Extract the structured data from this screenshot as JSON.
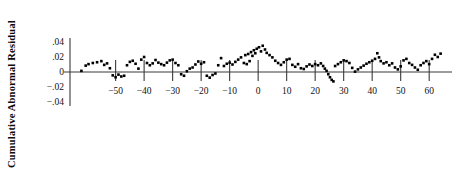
{
  "chart_data": {
    "type": "scatter",
    "title": "",
    "subtitle": "",
    "xlabel": "",
    "ylabel": "Cumulative Abnormal Residual",
    "xlim": [
      -66,
      68
    ],
    "ylim": [
      -0.045,
      0.047
    ],
    "xticks": [
      -50,
      -40,
      -30,
      -20,
      -10,
      0,
      10,
      20,
      30,
      40,
      50,
      60
    ],
    "xticklabels": [
      "−50",
      "−40",
      "−30",
      "−20",
      "−10",
      "0",
      "10",
      "20",
      "30",
      "40",
      "50",
      "60"
    ],
    "yticks": [
      0.04,
      0.02,
      0,
      -0.02,
      -0.04
    ],
    "yticklabels": [
      ".04",
      ".02",
      "0",
      "−.02",
      "−.04"
    ],
    "grid": false,
    "legend": null,
    "legend_position": "none",
    "marker": "square",
    "marker_color": "#000000",
    "marker_size": 2.6,
    "axis_color": "#3a3a3a",
    "zero_line": 0,
    "x": [
      -62,
      -61,
      -60,
      -59,
      -58,
      -57,
      -56,
      -55,
      -54,
      -53,
      -52,
      -51,
      -50,
      -49,
      -48,
      -47,
      -46,
      -45,
      -44,
      -43,
      -42,
      -41,
      -40,
      -39,
      -38,
      -37,
      -36,
      -35,
      -34,
      -33,
      -32,
      -31,
      -30,
      -29,
      -28,
      -27,
      -26,
      -25,
      -24,
      -23,
      -22,
      -21,
      -20,
      -19,
      -18,
      -17,
      -16,
      -15,
      -14,
      -13,
      -12,
      -11,
      -10,
      -9,
      -8,
      -7,
      -6,
      -5,
      -4,
      -3,
      -2,
      -1,
      0,
      1,
      2,
      3,
      4,
      5,
      6,
      7,
      8,
      9,
      10,
      11,
      12,
      13,
      14,
      15,
      16,
      17,
      18,
      19,
      20,
      21,
      22,
      23,
      24,
      25,
      26,
      27,
      28,
      29,
      30,
      31,
      32,
      33,
      34,
      35,
      36,
      37,
      38,
      39,
      40,
      41,
      42,
      43,
      44,
      45,
      46,
      47,
      48,
      49,
      50,
      51,
      52,
      53,
      54,
      55,
      56,
      57,
      58,
      59,
      60,
      61,
      62,
      63,
      64
    ],
    "y": [
      0.002,
      0.008,
      0.01,
      0.012,
      0.009,
      0.014,
      0.013,
      0.011,
      0.015,
      0.004,
      -0.004,
      -0.006,
      -0.003,
      -0.007,
      -0.005,
      0.009,
      0.013,
      0.015,
      0.011,
      0.004,
      0.016,
      0.02,
      0.012,
      0.009,
      0.011,
      0.016,
      0.013,
      0.011,
      0.009,
      0.012,
      0.015,
      0.016,
      0.012,
      0.009,
      -0.003,
      -0.005,
      0.001,
      0.004,
      0.006,
      0.01,
      0.014,
      0.011,
      0.013,
      -0.005,
      -0.007,
      -0.004,
      -0.002,
      0.009,
      0.018,
      0.008,
      0.011,
      0.012,
      0.01,
      0.013,
      0.016,
      0.019,
      0.012,
      0.01,
      0.011,
      0.014,
      0.017,
      0.02,
      0.021,
      0.023,
      0.026,
      0.024,
      0.031,
      0.027,
      0.03,
      0.033,
      0.035,
      0.028,
      0.03,
      0.034,
      0.032,
      0.03,
      0.036,
      0.033,
      0.035,
      0.031,
      0.028,
      0.024,
      0.021,
      0.017,
      0.013,
      0.009,
      0.012,
      0.016,
      0.019,
      0.018,
      0.009,
      0.006,
      0.005,
      0.01,
      0.008,
      0.005,
      0.004,
      0.007,
      0.01,
      0.008,
      0.006,
      0.004,
      0.012,
      0.01,
      0.009,
      0.005,
      0.002,
      -0.003,
      -0.007,
      -0.01,
      -0.012,
      0.002,
      0.006,
      0.01,
      0.013,
      0.011,
      0.015,
      0.017,
      0.014,
      0.012,
      0.009,
      0.0,
      0.0,
      0.0,
      0.0,
      0.0,
      0.0
    ]
  },
  "scatter_points": [
    {
      "x": -62,
      "y": 0.0015
    },
    {
      "x": -60.5,
      "y": 0.0085
    },
    {
      "x": -59.5,
      "y": 0.0105
    },
    {
      "x": -58,
      "y": 0.012
    },
    {
      "x": -56.5,
      "y": 0.013
    },
    {
      "x": -55,
      "y": 0.0145
    },
    {
      "x": -54,
      "y": 0.0095
    },
    {
      "x": -53,
      "y": 0.0115
    },
    {
      "x": -52,
      "y": 0.005
    },
    {
      "x": -51,
      "y": -0.0045
    },
    {
      "x": -50,
      "y": -0.007
    },
    {
      "x": -49,
      "y": -0.0035
    },
    {
      "x": -48,
      "y": -0.006
    },
    {
      "x": -47,
      "y": -0.005
    },
    {
      "x": -46,
      "y": 0.009
    },
    {
      "x": -45,
      "y": 0.0135
    },
    {
      "x": -44,
      "y": 0.015
    },
    {
      "x": -43,
      "y": 0.011
    },
    {
      "x": -42,
      "y": 0.0045
    },
    {
      "x": -41,
      "y": 0.0165
    },
    {
      "x": -40,
      "y": 0.02
    },
    {
      "x": -39,
      "y": 0.012
    },
    {
      "x": -38,
      "y": 0.009
    },
    {
      "x": -37,
      "y": 0.0115
    },
    {
      "x": -36,
      "y": 0.016
    },
    {
      "x": -35,
      "y": 0.0125
    },
    {
      "x": -34,
      "y": 0.0105
    },
    {
      "x": -33,
      "y": 0.009
    },
    {
      "x": -32,
      "y": 0.0125
    },
    {
      "x": -31,
      "y": 0.0155
    },
    {
      "x": -30,
      "y": 0.0165
    },
    {
      "x": -29,
      "y": 0.012
    },
    {
      "x": -28,
      "y": 0.009
    },
    {
      "x": -27,
      "y": -0.003
    },
    {
      "x": -26,
      "y": -0.005
    },
    {
      "x": -25,
      "y": 0.001
    },
    {
      "x": -24,
      "y": 0.0045
    },
    {
      "x": -23,
      "y": 0.006
    },
    {
      "x": -22,
      "y": 0.01
    },
    {
      "x": -21,
      "y": 0.014
    },
    {
      "x": -20,
      "y": 0.011
    },
    {
      "x": -19,
      "y": 0.013
    },
    {
      "x": -18,
      "y": -0.005
    },
    {
      "x": -17,
      "y": -0.0075
    },
    {
      "x": -16,
      "y": -0.004
    },
    {
      "x": -15,
      "y": -0.002
    },
    {
      "x": -14,
      "y": 0.009
    },
    {
      "x": -13,
      "y": 0.0185
    },
    {
      "x": -12,
      "y": 0.008
    },
    {
      "x": -11,
      "y": 0.011
    },
    {
      "x": -10,
      "y": 0.0125
    },
    {
      "x": -9,
      "y": 0.01
    },
    {
      "x": -8,
      "y": 0.0135
    },
    {
      "x": -7,
      "y": 0.0165
    },
    {
      "x": -6,
      "y": 0.0195
    },
    {
      "x": -5,
      "y": 0.012
    },
    {
      "x": -4.5,
      "y": 0.0225
    },
    {
      "x": -4,
      "y": 0.0105
    },
    {
      "x": -3.5,
      "y": 0.024
    },
    {
      "x": -3,
      "y": 0.0145
    },
    {
      "x": -2.5,
      "y": 0.0265
    },
    {
      "x": -2,
      "y": 0.0215
    },
    {
      "x": -1.5,
      "y": 0.029
    },
    {
      "x": -1,
      "y": 0.025
    },
    {
      "x": -0.5,
      "y": 0.031
    },
    {
      "x": 0.3,
      "y": 0.033
    },
    {
      "x": 1,
      "y": 0.0275
    },
    {
      "x": 1.6,
      "y": 0.035
    },
    {
      "x": 2.4,
      "y": 0.03
    },
    {
      "x": 3,
      "y": 0.0255
    },
    {
      "x": 4,
      "y": 0.0225
    },
    {
      "x": 5,
      "y": 0.0195
    },
    {
      "x": 6,
      "y": 0.015
    },
    {
      "x": 7,
      "y": 0.012
    },
    {
      "x": 8,
      "y": 0.0095
    },
    {
      "x": 9,
      "y": 0.013
    },
    {
      "x": 10,
      "y": 0.0165
    },
    {
      "x": 11,
      "y": 0.0175
    },
    {
      "x": 12,
      "y": 0.0095
    },
    {
      "x": 13,
      "y": 0.007
    },
    {
      "x": 14,
      "y": 0.0105
    },
    {
      "x": 15,
      "y": 0.005
    },
    {
      "x": 16,
      "y": 0.004
    },
    {
      "x": 17,
      "y": 0.0075
    },
    {
      "x": 18,
      "y": 0.01
    },
    {
      "x": 19,
      "y": 0.008
    },
    {
      "x": 20,
      "y": 0.0105
    },
    {
      "x": 21,
      "y": 0.009
    },
    {
      "x": 22,
      "y": 0.0115
    },
    {
      "x": 22.8,
      "y": 0.008
    },
    {
      "x": 23.4,
      "y": 0.0045
    },
    {
      "x": 24,
      "y": 0.0015
    },
    {
      "x": 24.6,
      "y": -0.003
    },
    {
      "x": 25.2,
      "y": -0.007
    },
    {
      "x": 25.8,
      "y": -0.0105
    },
    {
      "x": 26.4,
      "y": -0.0125
    },
    {
      "x": 27,
      "y": 0.008
    },
    {
      "x": 28,
      "y": 0.0105
    },
    {
      "x": 29,
      "y": 0.013
    },
    {
      "x": 30,
      "y": 0.0155
    },
    {
      "x": 31,
      "y": 0.0145
    },
    {
      "x": 32,
      "y": 0.012
    },
    {
      "x": 33,
      "y": 0.0055
    },
    {
      "x": 34,
      "y": 0.0005
    },
    {
      "x": 35,
      "y": 0.0035
    },
    {
      "x": 36,
      "y": 0.006
    },
    {
      "x": 37,
      "y": 0.0085
    },
    {
      "x": 38,
      "y": 0.011
    },
    {
      "x": 39,
      "y": 0.013
    },
    {
      "x": 40,
      "y": 0.015
    },
    {
      "x": 41,
      "y": 0.0175
    },
    {
      "x": 41.8,
      "y": 0.025
    },
    {
      "x": 42.4,
      "y": 0.0195
    },
    {
      "x": 43,
      "y": 0.0145
    },
    {
      "x": 44,
      "y": 0.0115
    },
    {
      "x": 45,
      "y": 0.013
    },
    {
      "x": 46,
      "y": 0.009
    },
    {
      "x": 47,
      "y": 0.0115
    },
    {
      "x": 48,
      "y": 0.006
    },
    {
      "x": 49,
      "y": 0.0035
    },
    {
      "x": 50,
      "y": 0.0075
    },
    {
      "x": 51,
      "y": 0.0155
    },
    {
      "x": 52,
      "y": 0.0175
    },
    {
      "x": 53,
      "y": 0.012
    },
    {
      "x": 54,
      "y": 0.0095
    },
    {
      "x": 55,
      "y": 0.006
    },
    {
      "x": 56,
      "y": 0.003
    },
    {
      "x": 57,
      "y": 0.009
    },
    {
      "x": 58,
      "y": 0.012
    },
    {
      "x": 59,
      "y": 0.0145
    },
    {
      "x": 60,
      "y": 0.0105
    },
    {
      "x": 61,
      "y": 0.0175
    },
    {
      "x": 62,
      "y": 0.023
    },
    {
      "x": 63,
      "y": 0.02
    },
    {
      "x": 64,
      "y": 0.0245
    }
  ]
}
